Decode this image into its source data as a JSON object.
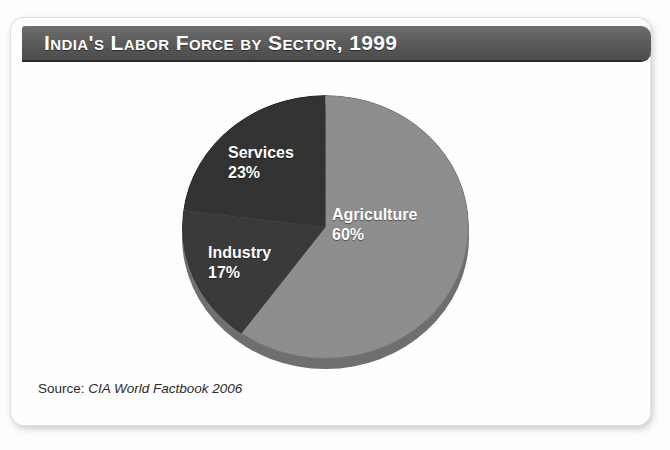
{
  "figure": {
    "title": "India's Labor Force by Sector, 1999",
    "source_label": "Source:",
    "source_value": "CIA World Factbook 2006"
  },
  "colors": {
    "banner_dark": "#464646",
    "banner_light": "#6d6d6d",
    "agriculture": "#8e8e8e",
    "industry": "#3a3a3a",
    "services": "#333333",
    "depth_edge": "#6f6f6f",
    "label_text": "#ffffff",
    "card_background": "#ffffff"
  },
  "chart_data": {
    "type": "pie",
    "title": "India's Labor Force by Sector, 1999",
    "subtitle": "",
    "xlabel": "",
    "ylabel": "",
    "units": "percent of labor force",
    "start_angle_deg": 0,
    "direction": "clockwise",
    "legend": "none (slices labeled in place)",
    "grid": false,
    "total": 100,
    "categories": [
      "Agriculture",
      "Industry",
      "Services"
    ],
    "values": [
      60,
      17,
      23
    ],
    "slices": [
      {
        "label": "Agriculture",
        "value": 60,
        "value_text": "60%",
        "color": "#8e8e8e",
        "start_angle_deg": 0,
        "end_angle_deg": 216
      },
      {
        "label": "Industry",
        "value": 17,
        "value_text": "17%",
        "color": "#3a3a3a",
        "start_angle_deg": 216,
        "end_angle_deg": 277.2
      },
      {
        "label": "Services",
        "value": 23,
        "value_text": "23%",
        "color": "#333333",
        "start_angle_deg": 277.2,
        "end_angle_deg": 360
      }
    ],
    "annotations": [
      "Agriculture 60%",
      "Industry 17%",
      "Services 23%"
    ],
    "source": "CIA World Factbook 2006"
  }
}
